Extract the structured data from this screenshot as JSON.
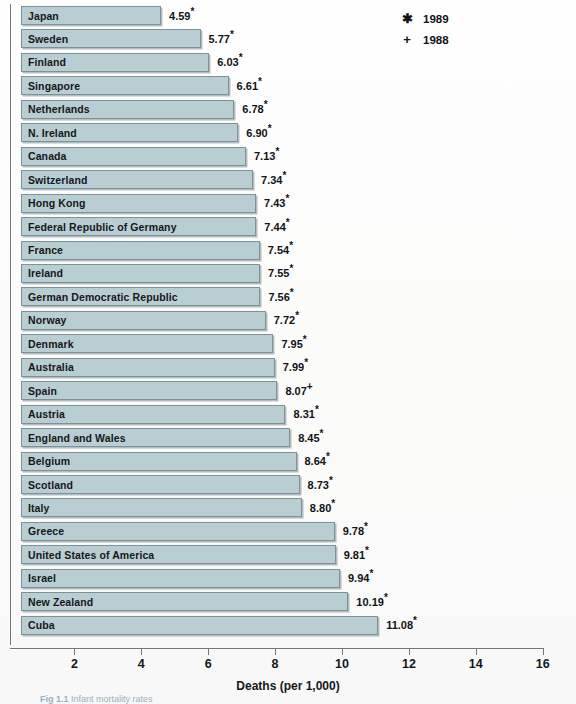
{
  "chart_data": {
    "type": "bar",
    "orientation": "horizontal",
    "title": "",
    "xlabel": "Deaths (per 1,000)",
    "ylabel": "",
    "xlim": [
      0,
      16
    ],
    "xticks": [
      2,
      4,
      6,
      8,
      10,
      12,
      14,
      16
    ],
    "xtick_labels": [
      "2",
      "4",
      "6",
      "8",
      "10",
      "12",
      "14",
      "16"
    ],
    "grid": false,
    "legend_position": "top-right",
    "categories": [
      "Japan",
      "Sweden",
      "Finland",
      "Singapore",
      "Netherlands",
      "N. Ireland",
      "Canada",
      "Switzerland",
      "Hong Kong",
      "Federal Republic of Germany",
      "France",
      "Ireland",
      "German Democratic Republic",
      "Norway",
      "Denmark",
      "Australia",
      "Spain",
      "Austria",
      "England and Wales",
      "Belgium",
      "Scotland",
      "Italy",
      "Greece",
      "United States of America",
      "Israel",
      "New Zealand",
      "Cuba"
    ],
    "values": [
      4.59,
      5.77,
      6.03,
      6.61,
      6.78,
      6.9,
      7.13,
      7.34,
      7.43,
      7.44,
      7.54,
      7.55,
      7.56,
      7.72,
      7.95,
      7.99,
      8.07,
      8.31,
      8.45,
      8.64,
      8.73,
      8.8,
      9.78,
      9.81,
      9.94,
      10.19,
      11.08
    ],
    "value_labels": [
      "4.59",
      "5.77",
      "6.03",
      "6.61",
      "6.78",
      "6.90",
      "7.13",
      "7.34",
      "7.43",
      "7.44",
      "7.54",
      "7.55",
      "7.56",
      "7.72",
      "7.95",
      "7.99",
      "8.07",
      "8.31",
      "8.45",
      "8.64",
      "8.73",
      "8.80",
      "9.78",
      "9.81",
      "9.94",
      "10.19",
      "11.08"
    ],
    "year_markers": [
      "*",
      "*",
      "*",
      "*",
      "*",
      "*",
      "*",
      "*",
      "*",
      "*",
      "*",
      "*",
      "*",
      "*",
      "*",
      "*",
      "+",
      "*",
      "*",
      "*",
      "*",
      "*",
      "*",
      "*",
      "*",
      "*",
      "*"
    ],
    "bar_color": "#b9ced2",
    "bar_edge_color": "#7d9298"
  },
  "legend": {
    "items": [
      {
        "symbol": "✱",
        "label": "1989"
      },
      {
        "symbol": "+",
        "label": "1988"
      }
    ]
  },
  "caption": {
    "figure_number": "Fig 1.1",
    "text": "Infant mortality rates"
  }
}
